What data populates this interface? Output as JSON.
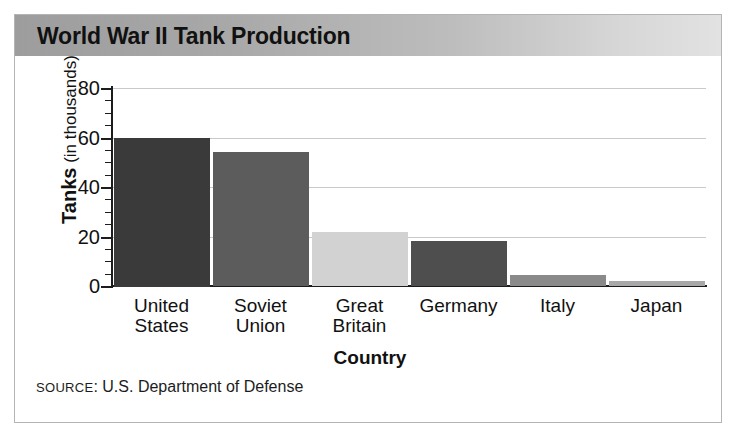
{
  "title": "World War II Tank Production",
  "source_note": {
    "prefix": "SOURCE",
    "separator": ": ",
    "text": "U.S. Department of Defense"
  },
  "axis": {
    "y_title_strong": "Tanks",
    "y_title_rest": " (in thousands)",
    "x_title": "Country"
  },
  "colors": {
    "frame": "#b4b4b4",
    "gridline": "#c9c9c9",
    "axis": "#1c1c1c",
    "title_bar_dark": "#9d9d9d",
    "title_bar_light": "#e2e2e2",
    "background": "#ffffff"
  },
  "chart_data": {
    "type": "bar",
    "title": "World War II Tank Production",
    "xlabel": "Country",
    "ylabel": "Tanks (in thousands)",
    "ylim": [
      0,
      80
    ],
    "yticks": [
      0,
      20,
      40,
      60,
      80
    ],
    "y_minor_tick_step": 5,
    "grid": true,
    "legend": "none",
    "units": "thousands of tanks",
    "categories": [
      "United States",
      "Soviet Union",
      "Great Britain",
      "Germany",
      "Italy",
      "Japan"
    ],
    "category_lines": [
      [
        "United",
        "States"
      ],
      [
        "Soviet",
        "Union"
      ],
      [
        "Great",
        "Britain"
      ],
      [
        "Germany"
      ],
      [
        "Italy"
      ],
      [
        "Japan"
      ]
    ],
    "values": [
      60,
      54,
      22,
      18,
      4.5,
      2
    ],
    "bar_colors": [
      "#3a3a3a",
      "#5c5c5c",
      "#d2d2d2",
      "#4e4e4e",
      "#8a8a8a",
      "#a8a8a8"
    ]
  }
}
